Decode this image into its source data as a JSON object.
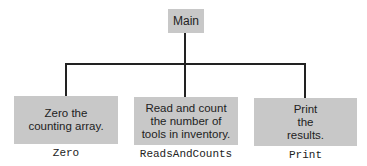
{
  "diagram": {
    "type": "structure-chart",
    "root": {
      "label": "Main"
    },
    "children": [
      {
        "description": "Zero the counting array.",
        "module_name": "Zero"
      },
      {
        "description": "Read and count the number of tools in inventory.",
        "module_name": "ReadsAndCounts"
      },
      {
        "description": "Print the results.",
        "module_name": "Print"
      }
    ]
  }
}
